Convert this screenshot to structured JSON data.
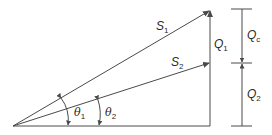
{
  "diagram": {
    "type": "power-triangle",
    "colors": {
      "line": "#4a4a4a",
      "text": "#2a2a2a",
      "background": "#ffffff"
    },
    "labels": {
      "S1": {
        "base": "S",
        "sub": "1"
      },
      "S2": {
        "base": "S",
        "sub": "2"
      },
      "Q1": {
        "base": "Q",
        "sub": "1"
      },
      "Qc": {
        "base": "Q",
        "sub": "c"
      },
      "Q2": {
        "base": "Q",
        "sub": "2"
      },
      "theta1": {
        "base": "θ",
        "sub": "1"
      },
      "theta2": {
        "base": "θ",
        "sub": "2"
      }
    }
  }
}
